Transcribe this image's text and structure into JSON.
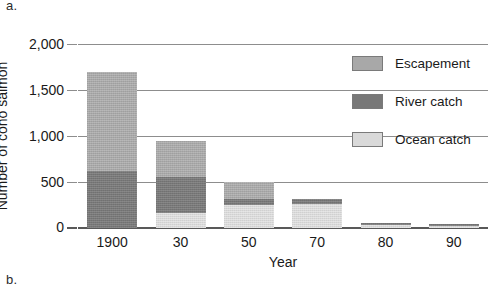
{
  "figure": {
    "panel_letter_a": "a.",
    "panel_letter_b": "b."
  },
  "chart_data": {
    "type": "bar",
    "stacked": true,
    "title": "",
    "xlabel": "Year",
    "ylabel": "Number of coho salmon",
    "categories": [
      "1900",
      "30",
      "50",
      "70",
      "80",
      "90"
    ],
    "ylim": [
      0,
      2000
    ],
    "yticks": [
      0,
      500,
      1000,
      1500,
      2000
    ],
    "ytick_labels": [
      "0",
      "500",
      "1,000",
      "1,500",
      "2,000"
    ],
    "grid": true,
    "legend_position": "upper-right",
    "series": [
      {
        "name": "Escapement",
        "color": "#a8a8a8",
        "values": [
          1080,
          395,
          190,
          0,
          0,
          0
        ]
      },
      {
        "name": "River catch",
        "color": "#787878",
        "values": [
          620,
          385,
          60,
          55,
          25,
          20
        ]
      },
      {
        "name": "Ocean catch",
        "color": "#d9d9d9",
        "values": [
          0,
          165,
          250,
          260,
          30,
          20
        ]
      }
    ],
    "totals": [
      1700,
      945,
      500,
      315,
      55,
      40
    ],
    "stack_order": [
      "Ocean catch",
      "River catch",
      "Escapement"
    ]
  },
  "legend": {
    "items": [
      {
        "label": "Escapement",
        "color": "#a8a8a8",
        "swatch": "escapement-swatch"
      },
      {
        "label": "River catch",
        "color": "#787878",
        "swatch": "river-catch-swatch"
      },
      {
        "label": "Ocean catch",
        "color": "#d9d9d9",
        "swatch": "ocean-catch-swatch"
      }
    ]
  }
}
